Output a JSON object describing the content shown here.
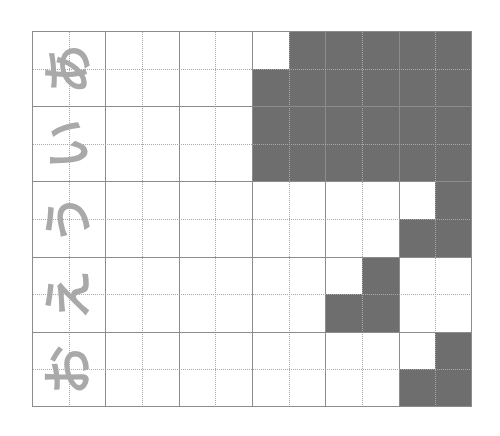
{
  "worksheet": {
    "columns": 6,
    "rows": 5,
    "sub_divisions": 2,
    "characters": [
      "あ",
      "い",
      "う",
      "え",
      "お"
    ],
    "character_rotation_deg": -90,
    "colors": {
      "background": "#ffffff",
      "shaded": "#6e6e6e",
      "solid_line": "#8c8c8c",
      "dotted_line": "#a8a8a8",
      "character": "#a9a9a9"
    },
    "shaded_cells": [
      [
        0,
        7
      ],
      [
        0,
        8
      ],
      [
        0,
        9
      ],
      [
        0,
        10
      ],
      [
        0,
        11
      ],
      [
        1,
        6
      ],
      [
        1,
        7
      ],
      [
        1,
        8
      ],
      [
        1,
        9
      ],
      [
        1,
        10
      ],
      [
        1,
        11
      ],
      [
        2,
        6
      ],
      [
        2,
        7
      ],
      [
        2,
        8
      ],
      [
        2,
        9
      ],
      [
        2,
        10
      ],
      [
        2,
        11
      ],
      [
        3,
        6
      ],
      [
        3,
        7
      ],
      [
        3,
        8
      ],
      [
        3,
        9
      ],
      [
        3,
        10
      ],
      [
        3,
        11
      ],
      [
        4,
        11
      ],
      [
        5,
        10
      ],
      [
        5,
        11
      ],
      [
        6,
        9
      ],
      [
        7,
        8
      ],
      [
        7,
        9
      ],
      [
        8,
        11
      ],
      [
        9,
        10
      ],
      [
        9,
        11
      ]
    ]
  }
}
